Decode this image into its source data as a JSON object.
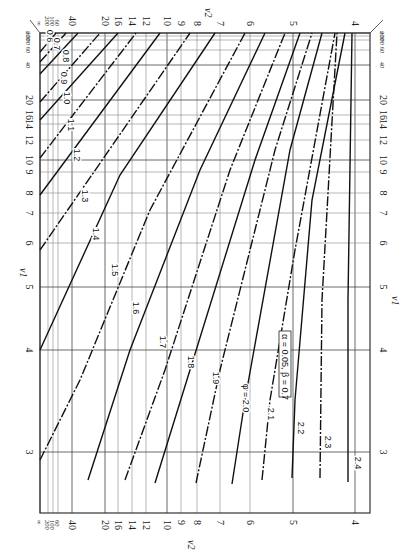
{
  "chart_data": {
    "type": "line",
    "orientation": "rotated-90-clockwise",
    "annotation": "α = 0.05, β = 0.7",
    "curve_parameter": "φ",
    "x_axis": {
      "label": "ν2",
      "position": "top and bottom",
      "ticks": [
        "∞",
        "200",
        "100",
        "60",
        "40",
        "20",
        "16",
        "14",
        "12",
        "10",
        "9",
        "8",
        "7",
        "6",
        "5",
        "4"
      ]
    },
    "y_axis": {
      "label": "ν1",
      "position": "left and right",
      "ticks": [
        "∞",
        "200",
        "100",
        "60",
        "40",
        "20",
        "16",
        "14",
        "12",
        "10",
        "9",
        "8",
        "7",
        "6",
        "5",
        "4",
        "3"
      ]
    },
    "grid": true,
    "series": [
      {
        "name": "0.6",
        "style": "dashed"
      },
      {
        "name": "0.7",
        "style": "dashed"
      },
      {
        "name": "0.8",
        "style": "solid"
      },
      {
        "name": "0.9",
        "style": "dashed"
      },
      {
        "name": "1.0",
        "style": "solid"
      },
      {
        "name": "1.1",
        "style": "dashed"
      },
      {
        "name": "1.2",
        "style": "solid"
      },
      {
        "name": "1.3",
        "style": "dashed"
      },
      {
        "name": "1.4",
        "style": "solid"
      },
      {
        "name": "1.5",
        "style": "dashed"
      },
      {
        "name": "1.6",
        "style": "solid"
      },
      {
        "name": "1.7",
        "style": "dashed"
      },
      {
        "name": "1.8",
        "style": "solid"
      },
      {
        "name": "1.9",
        "style": "dashed"
      },
      {
        "name": "φ = 2.0",
        "style": "solid"
      },
      {
        "name": "2.1",
        "style": "dashed"
      },
      {
        "name": "2.2",
        "style": "solid"
      },
      {
        "name": "2.3",
        "style": "dashed"
      },
      {
        "name": "2.4",
        "style": "solid"
      }
    ]
  },
  "labels": {
    "nu1": "ν1",
    "nu2": "ν2",
    "nu1_sub": "1",
    "nu2_sub": "2",
    "legend": "α = 0.05, β = 0.7",
    "phi20": "φ = 2.0"
  },
  "nu2_ticks": [
    {
      "label": "∞",
      "x": 40,
      "small": true
    },
    {
      "label": "200",
      "x": 48,
      "small": true
    },
    {
      "label": "100",
      "x": 53,
      "small": true
    },
    {
      "label": "60",
      "x": 58,
      "small": true
    },
    {
      "label": "40",
      "x": 72
    },
    {
      "label": "20",
      "x": 105
    },
    {
      "label": "16",
      "x": 118
    },
    {
      "label": "14",
      "x": 132
    },
    {
      "label": "12",
      "x": 146
    },
    {
      "label": "10",
      "x": 167
    },
    {
      "label": "9",
      "x": 181
    },
    {
      "label": "8",
      "x": 197
    },
    {
      "label": "7",
      "x": 220
    },
    {
      "label": "6",
      "x": 250
    },
    {
      "label": "5",
      "x": 293
    },
    {
      "label": "4",
      "x": 355
    }
  ],
  "nu1_ticks": [
    {
      "label": "∞",
      "y": 33,
      "small": true
    },
    {
      "label": "200",
      "y": 36,
      "small": true
    },
    {
      "label": "100",
      "y": 40,
      "small": true
    },
    {
      "label": "60",
      "y": 50,
      "small": true
    },
    {
      "label": "40",
      "y": 65,
      "small": true
    },
    {
      "label": "20",
      "y": 100
    },
    {
      "label": "16",
      "y": 115
    },
    {
      "label": "14",
      "y": 124
    },
    {
      "label": "12",
      "y": 140
    },
    {
      "label": "10",
      "y": 160
    },
    {
      "label": "9",
      "y": 172
    },
    {
      "label": "8",
      "y": 193
    },
    {
      "label": "7",
      "y": 213
    },
    {
      "label": "6",
      "y": 243
    },
    {
      "label": "5",
      "y": 287
    },
    {
      "label": "4",
      "y": 350
    },
    {
      "label": "3",
      "y": 452
    }
  ],
  "curves": [
    {
      "label": "0.6",
      "dash": true,
      "pts": [
        [
          40,
          52
        ],
        [
          56,
          33
        ]
      ],
      "lx": 47,
      "ly": 36
    },
    {
      "label": "0.7",
      "dash": true,
      "pts": [
        [
          40,
          62
        ],
        [
          66,
          33
        ]
      ],
      "lx": 54,
      "ly": 44
    },
    {
      "label": "0.8",
      "dash": false,
      "pts": [
        [
          40,
          74
        ],
        [
          78,
          33
        ]
      ],
      "lx": 63,
      "ly": 56
    },
    {
      "label": "0.9",
      "dash": true,
      "pts": [
        [
          40,
          102
        ],
        [
          100,
          33
        ]
      ],
      "lx": 61,
      "ly": 78
    },
    {
      "label": "1.0",
      "dash": false,
      "pts": [
        [
          40,
          120
        ],
        [
          118,
          33
        ]
      ],
      "lx": 64,
      "ly": 98
    },
    {
      "label": "1.1",
      "dash": true,
      "pts": [
        [
          40,
          158
        ],
        [
          136,
          33
        ]
      ],
      "lx": 68,
      "ly": 125
    },
    {
      "label": "1.2",
      "dash": false,
      "pts": [
        [
          40,
          195
        ],
        [
          160,
          33
        ]
      ],
      "lx": 74,
      "ly": 155
    },
    {
      "label": "1.3",
      "dash": true,
      "pts": [
        [
          40,
          250
        ],
        [
          190,
          33
        ]
      ],
      "lx": 82,
      "ly": 196
    },
    {
      "label": "1.4",
      "dash": false,
      "pts": [
        [
          40,
          350
        ],
        [
          120,
          175
        ],
        [
          215,
          33
        ]
      ],
      "lx": 93,
      "ly": 234
    },
    {
      "label": "1.5",
      "dash": true,
      "pts": [
        [
          40,
          460
        ],
        [
          80,
          380
        ],
        [
          150,
          210
        ],
        [
          245,
          33
        ]
      ],
      "lx": 112,
      "ly": 270
    },
    {
      "label": "1.6",
      "dash": false,
      "pts": [
        [
          88,
          480
        ],
        [
          130,
          350
        ],
        [
          200,
          170
        ],
        [
          265,
          33
        ]
      ],
      "lx": 133,
      "ly": 308
    },
    {
      "label": "1.7",
      "dash": true,
      "pts": [
        [
          125,
          480
        ],
        [
          165,
          370
        ],
        [
          230,
          170
        ],
        [
          285,
          33
        ]
      ],
      "lx": 160,
      "ly": 342
    },
    {
      "label": "1.8",
      "dash": false,
      "pts": [
        [
          155,
          483
        ],
        [
          190,
          370
        ],
        [
          255,
          160
        ],
        [
          300,
          33
        ]
      ],
      "lx": 188,
      "ly": 362
    },
    {
      "label": "1.9",
      "dash": true,
      "pts": [
        [
          196,
          483
        ],
        [
          220,
          370
        ],
        [
          275,
          150
        ],
        [
          312,
          33
        ]
      ],
      "lx": 213,
      "ly": 378
    },
    {
      "label": "φ = 2.0",
      "dash": false,
      "pts": [
        [
          232,
          484
        ],
        [
          245,
          400
        ],
        [
          290,
          150
        ],
        [
          322,
          33
        ]
      ],
      "lx": 243,
      "ly": 398
    },
    {
      "label": "2.1",
      "dash": true,
      "pts": [
        [
          262,
          480
        ],
        [
          270,
          400
        ],
        [
          295,
          250
        ],
        [
          335,
          33
        ]
      ],
      "lx": 268,
      "ly": 414
    },
    {
      "label": "2.2",
      "dash": false,
      "pts": [
        [
          292,
          478
        ],
        [
          295,
          400
        ],
        [
          312,
          200
        ],
        [
          345,
          33
        ]
      ],
      "lx": 298,
      "ly": 428
    },
    {
      "label": "2.3",
      "dash": true,
      "pts": [
        [
          320,
          478
        ],
        [
          322,
          300
        ],
        [
          337,
          33
        ]
      ],
      "lx": 325,
      "ly": 442
    },
    {
      "label": "2.4",
      "dash": false,
      "pts": [
        [
          348,
          482
        ],
        [
          348,
          300
        ],
        [
          352,
          33
        ]
      ],
      "lx": 355,
      "ly": 463
    }
  ]
}
